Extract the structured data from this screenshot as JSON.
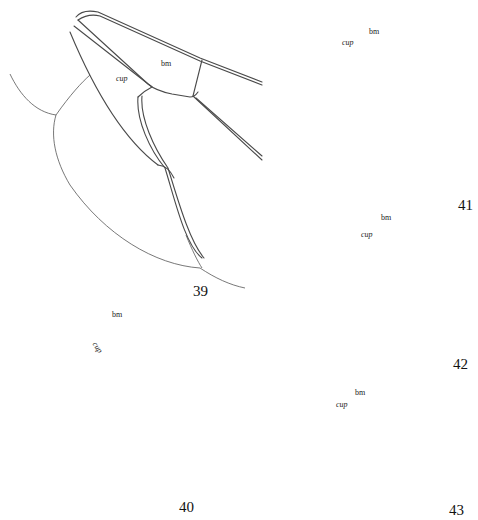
{
  "figure": {
    "type": "wing venation line drawings",
    "panels": [
      {
        "number": "39",
        "labels": {
          "bm": "bm",
          "cup": "cup"
        }
      },
      {
        "number": "40",
        "labels": {
          "bm": "bm",
          "cup": "cup"
        }
      },
      {
        "number": "41",
        "labels": {
          "bm": "bm",
          "cup": "cup"
        }
      },
      {
        "number": "42",
        "labels": {
          "bm": "bm",
          "cup": "cup"
        }
      },
      {
        "number": "43",
        "labels": {
          "bm": "bm",
          "cup": "cup"
        }
      }
    ],
    "colors": {
      "line": "#4a4a4a",
      "background": "#ffffff"
    }
  }
}
